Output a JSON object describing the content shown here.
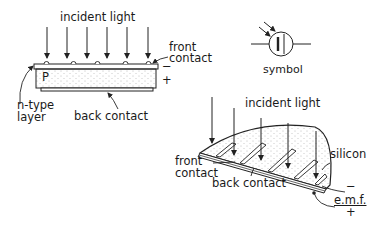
{
  "diagram": {
    "flat_cell": {
      "incident_light_label": "incident light",
      "front_contact_label_line1": "front",
      "front_contact_label_line2": "contact",
      "p_label": "P",
      "minus_sign": "−",
      "plus_sign": "+",
      "n_type_label_line1": "n-type",
      "n_type_label_line2": "layer",
      "back_contact_label": "back contact"
    },
    "symbol": {
      "label": "symbol"
    },
    "curved_cell": {
      "incident_light_label": "incident light",
      "silicon_label": "silicon",
      "front_contact_label_line1": "front",
      "front_contact_label_line2": "contact",
      "back_contact_label": "back contact",
      "emf_label": "e.m.f.",
      "minus_sign": "−",
      "plus_sign": "+"
    }
  }
}
